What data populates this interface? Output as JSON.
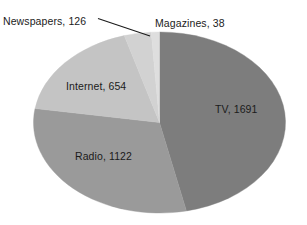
{
  "chart_data": {
    "type": "pie",
    "title": "",
    "categories": [
      "TV",
      "Radio",
      "Internet",
      "Newspapers",
      "Magazines"
    ],
    "values": [
      1691,
      1122,
      654,
      126,
      38
    ],
    "total": 3631,
    "legend": "none",
    "labels_position": "on-slice-and-callout",
    "start_angle_deg": 0,
    "direction": "clockwise",
    "slices": [
      {
        "name": "TV",
        "value": 1691,
        "label": "TV, 1691",
        "color": "#7d7d7d",
        "percent": 46.57,
        "label_placement": "inside"
      },
      {
        "name": "Radio",
        "value": 1122,
        "label": "Radio, 1122",
        "color": "#9a9a9a",
        "percent": 30.9,
        "label_placement": "inside"
      },
      {
        "name": "Internet",
        "value": 654,
        "label": "Internet, 654",
        "color": "#c4c4c4",
        "percent": 18.01,
        "label_placement": "inside"
      },
      {
        "name": "Newspapers",
        "value": 126,
        "label": "Newspapers, 126",
        "color": "#d2d2d2",
        "percent": 3.47,
        "label_placement": "callout"
      },
      {
        "name": "Magazines",
        "value": 38,
        "label": "Magazines, 38",
        "color": "#dedede",
        "percent": 1.05,
        "label_placement": "callout"
      }
    ],
    "colors": {
      "tv": "#7d7d7d",
      "radio": "#9a9a9a",
      "internet": "#c4c4c4",
      "newspapers": "#d2d2d2",
      "magazines": "#dedede",
      "background": "#ffffff",
      "text": "#1b1b1b",
      "leader_line": "#1b1b1b"
    }
  },
  "labels": {
    "tv": "TV, 1691",
    "radio": "Radio, 1122",
    "internet": "Internet, 654",
    "newspapers": "Newspapers, 126",
    "magazines": "Magazines, 38"
  }
}
